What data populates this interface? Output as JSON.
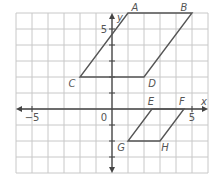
{
  "diagram": {
    "type": "coordinate-plane",
    "grid": {
      "xmin": -6,
      "xmax": 6,
      "ymin": -4,
      "ymax": 6,
      "cell_px": 16,
      "origin_px": [
        112,
        109
      ],
      "grid_color": "#c8c8c8",
      "axis_color": "#444444",
      "line_color": "#555555"
    },
    "axes": {
      "x_label": "x",
      "y_label": "y",
      "origin_label": "0",
      "x_ticks": [
        {
          "value": -5,
          "label": "−5"
        },
        {
          "value": 5,
          "label": "5"
        }
      ],
      "y_ticks": [
        {
          "value": 5,
          "label": "5"
        }
      ]
    },
    "shapes": [
      {
        "name": "parallelogram-ABDC",
        "vertices": [
          {
            "label": "A",
            "x": 1,
            "y": 6
          },
          {
            "label": "B",
            "x": 5,
            "y": 6
          },
          {
            "label": "D",
            "x": 2,
            "y": 2
          },
          {
            "label": "C",
            "x": -2,
            "y": 2
          }
        ]
      },
      {
        "name": "parallelogram-EFHG",
        "vertices": [
          {
            "label": "E",
            "x": 2.5,
            "y": 0
          },
          {
            "label": "F",
            "x": 4.5,
            "y": 0
          },
          {
            "label": "H",
            "x": 3,
            "y": -2
          },
          {
            "label": "G",
            "x": 1,
            "y": -2
          }
        ]
      }
    ]
  }
}
